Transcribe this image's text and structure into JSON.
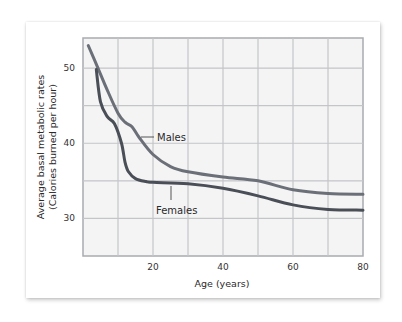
{
  "chart_data": {
    "type": "line",
    "title": "",
    "xlabel": "Age (years)",
    "ylabel": "Average basal metabolic rates (Calories burned per hour)",
    "ylabel_lines": [
      "Average basal metabolic rates",
      "(Calories burned per hour)"
    ],
    "xlim": [
      0,
      80
    ],
    "ylim": [
      25,
      54
    ],
    "x_ticks": [
      20,
      40,
      60,
      80
    ],
    "y_ticks": [
      30,
      40,
      50
    ],
    "x_grid_step": 10,
    "y_grid_step": 5,
    "grid": true,
    "legend_position": "inline labels",
    "series": [
      {
        "name": "Males",
        "color": "#6b6f78",
        "x": [
          1.5,
          4,
          7,
          10,
          12,
          14,
          16,
          20,
          25,
          30,
          40,
          50,
          60,
          70,
          80
        ],
        "values": [
          53.0,
          50.3,
          47.0,
          44.0,
          42.8,
          42.2,
          40.8,
          38.5,
          36.9,
          36.2,
          35.5,
          35.0,
          33.8,
          33.3,
          33.2
        ]
      },
      {
        "name": "Females",
        "color": "#4a4e57",
        "x": [
          3.8,
          5,
          7,
          9,
          11,
          12,
          13,
          15,
          18,
          20,
          30,
          40,
          50,
          60,
          70,
          80
        ],
        "values": [
          49.8,
          45.5,
          43.5,
          42.6,
          40.0,
          37.5,
          36.2,
          35.3,
          34.9,
          34.8,
          34.6,
          34.0,
          33.0,
          31.8,
          31.2,
          31.1
        ]
      }
    ],
    "annotations": [
      {
        "text": "Males",
        "target_series": "Males",
        "x": 18
      },
      {
        "text": "Females",
        "target_series": "Females",
        "x": 25
      }
    ]
  },
  "labels": {
    "males": "Males",
    "females": "Females",
    "x_title": "Age (years)",
    "y_title_line1": "Average basal metabolic rates",
    "y_title_line2": "(Calories burned per hour)"
  }
}
